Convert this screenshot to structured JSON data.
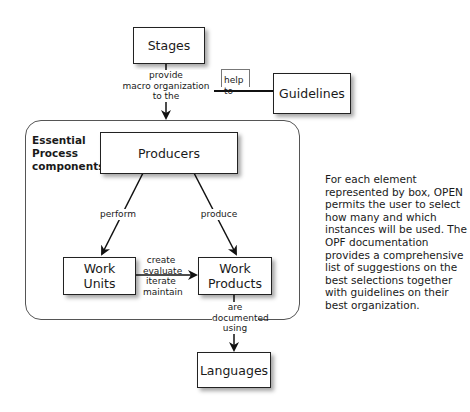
{
  "diagram": {
    "nodes": {
      "stages": "Stages",
      "guidelines": "Guidelines",
      "producers": "Producers",
      "work_units": "Work Units",
      "work_products": "Work Products",
      "languages": "Languages"
    },
    "container_title": "Essential Process components",
    "edges": {
      "stages_to_container": "provide macro organization to the",
      "guidelines_to_stages_edge": "help to",
      "producers_to_work_units": "perform",
      "producers_to_work_products": "produce",
      "work_units_to_work_products": "create evaluate iterate maintain",
      "work_products_to_languages": "are documented using"
    },
    "edge_lines": {
      "stages_to_container": [
        "provide",
        "macro organization",
        "to the"
      ],
      "work_units_to_work_products": [
        "create",
        "evaluate",
        "iterate",
        "maintain"
      ],
      "work_products_to_languages": [
        "are",
        "documented",
        "using"
      ]
    },
    "node_lines": {
      "work_units": [
        "Work",
        "Units"
      ],
      "work_products": [
        "Work",
        "Products"
      ]
    },
    "title_lines": [
      "Essential",
      "Process",
      "components"
    ]
  },
  "description": "For each element represented by box, OPEN permits the user to select how many and which instances will be used. The OPF documentation provides a comprehensive list of suggestions on the best selections together with guidelines on their best organization."
}
